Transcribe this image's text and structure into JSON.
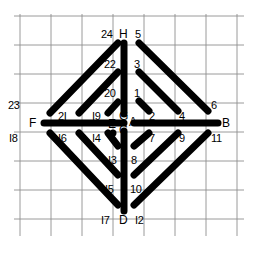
{
  "figure": {
    "type": "line-diagram",
    "canvas": {
      "width": 260,
      "height": 263
    },
    "colors": {
      "stroke": "#000000",
      "grid": "#8a8a8a",
      "background": "#ffffff"
    },
    "grid": {
      "visible": true,
      "x_lines": [
        20,
        51,
        82,
        113,
        144,
        175,
        206,
        237
      ],
      "y_lines": [
        16,
        45,
        74,
        103,
        132,
        161,
        190,
        219,
        234
      ]
    },
    "nodes": {
      "A": {
        "x": 133,
        "y": 124
      },
      "B": {
        "x": 219,
        "y": 124
      },
      "C": {
        "x": 124,
        "y": 131
      },
      "D": {
        "x": 124,
        "y": 211
      },
      "E": {
        "x": 126,
        "y": 124
      },
      "F": {
        "x": 43,
        "y": 124
      },
      "G": {
        "x": 124,
        "y": 116
      },
      "H": {
        "x": 124,
        "y": 43
      }
    },
    "segments": [
      {
        "id": "H-G",
        "from": "H",
        "to": "G",
        "ends": [
          "H",
          "G"
        ],
        "orientation": "vertical"
      },
      {
        "id": "C-D",
        "from": "C",
        "to": "D",
        "ends": [
          "C",
          "D"
        ],
        "orientation": "vertical"
      },
      {
        "id": "F-E",
        "from": "F",
        "to": "E",
        "ends": [
          "F",
          "E"
        ],
        "orientation": "horizontal"
      },
      {
        "id": "A-B",
        "from": "A",
        "to": "B",
        "ends": [
          "A",
          "B"
        ],
        "orientation": "horizontal"
      },
      {
        "id": "1-2",
        "ends": [
          "1",
          "2"
        ],
        "orientation": "diagonal-down-right"
      },
      {
        "id": "3-4",
        "ends": [
          "3",
          "4"
        ],
        "orientation": "diagonal-down-right"
      },
      {
        "id": "5-6",
        "ends": [
          "5",
          "6"
        ],
        "orientation": "diagonal-down-right"
      },
      {
        "id": "7-8",
        "ends": [
          "7",
          "8"
        ],
        "orientation": "diagonal-down-left"
      },
      {
        "id": "9-10",
        "ends": [
          "9",
          "10"
        ],
        "orientation": "diagonal-down-left"
      },
      {
        "id": "11-12",
        "ends": [
          "11",
          "12"
        ],
        "orientation": "diagonal-down-left"
      },
      {
        "id": "13-14",
        "ends": [
          "I3",
          "I4"
        ],
        "orientation": "diagonal-down-left"
      },
      {
        "id": "15-16",
        "ends": [
          "I5",
          "I6"
        ],
        "orientation": "diagonal-down-left"
      },
      {
        "id": "17-18",
        "ends": [
          "I7",
          "I8"
        ],
        "orientation": "diagonal-down-left"
      },
      {
        "id": "19-20",
        "ends": [
          "I9",
          "20"
        ],
        "orientation": "diagonal-up-right"
      },
      {
        "id": "21-22",
        "ends": [
          "2I",
          "22"
        ],
        "orientation": "diagonal-up-right"
      },
      {
        "id": "23-24",
        "ends": [
          "23",
          "24"
        ],
        "orientation": "diagonal-up-right"
      }
    ],
    "labels": [
      {
        "id": "lab-24",
        "text": "24",
        "x": 101,
        "y": 29,
        "kind": "number"
      },
      {
        "id": "lab-H",
        "text": "H",
        "x": 119,
        "y": 29,
        "kind": "letter"
      },
      {
        "id": "lab-5",
        "text": "5",
        "x": 135,
        "y": 29,
        "kind": "number"
      },
      {
        "id": "lab-22",
        "text": "22",
        "x": 104,
        "y": 59,
        "kind": "number"
      },
      {
        "id": "lab-3",
        "text": "3",
        "x": 134,
        "y": 59,
        "kind": "number"
      },
      {
        "id": "lab-20",
        "text": "20",
        "x": 104,
        "y": 88,
        "kind": "number"
      },
      {
        "id": "lab-1",
        "text": "1",
        "x": 134,
        "y": 88,
        "kind": "number"
      },
      {
        "id": "lab-23",
        "text": "23",
        "x": 8,
        "y": 100,
        "kind": "number"
      },
      {
        "id": "lab-21",
        "text": "2I",
        "x": 58,
        "y": 111,
        "kind": "number"
      },
      {
        "id": "lab-19",
        "text": "I9",
        "x": 92,
        "y": 111,
        "kind": "number"
      },
      {
        "id": "lab-2",
        "text": "2",
        "x": 149,
        "y": 111,
        "kind": "number"
      },
      {
        "id": "lab-4",
        "text": "4",
        "x": 179,
        "y": 111,
        "kind": "number"
      },
      {
        "id": "lab-6",
        "text": "6",
        "x": 211,
        "y": 100,
        "kind": "number"
      },
      {
        "id": "lab-G",
        "text": "G",
        "x": 119,
        "y": 111,
        "kind": "letter"
      },
      {
        "id": "lab-A",
        "text": "A",
        "x": 129,
        "y": 117,
        "kind": "letter"
      },
      {
        "id": "lab-E",
        "text": "E",
        "x": 108,
        "y": 119,
        "kind": "letter"
      },
      {
        "id": "lab-C",
        "text": "C",
        "x": 119,
        "y": 125,
        "kind": "letter"
      },
      {
        "id": "lab-F",
        "text": "F",
        "x": 29,
        "y": 118,
        "kind": "letter"
      },
      {
        "id": "lab-B",
        "text": "B",
        "x": 222,
        "y": 118,
        "kind": "letter"
      },
      {
        "id": "lab-18",
        "text": "I8",
        "x": 9,
        "y": 133,
        "kind": "number"
      },
      {
        "id": "lab-16",
        "text": "I6",
        "x": 58,
        "y": 133,
        "kind": "number"
      },
      {
        "id": "lab-14",
        "text": "I4",
        "x": 92,
        "y": 133,
        "kind": "number"
      },
      {
        "id": "lab-7",
        "text": "7",
        "x": 149,
        "y": 133,
        "kind": "number"
      },
      {
        "id": "lab-9",
        "text": "9",
        "x": 179,
        "y": 133,
        "kind": "number"
      },
      {
        "id": "lab-11",
        "text": "11",
        "x": 211,
        "y": 133,
        "kind": "number"
      },
      {
        "id": "lab-13",
        "text": "I3",
        "x": 108,
        "y": 155,
        "kind": "number"
      },
      {
        "id": "lab-8",
        "text": "8",
        "x": 131,
        "y": 155,
        "kind": "number"
      },
      {
        "id": "lab-15",
        "text": "I5",
        "x": 105,
        "y": 184,
        "kind": "number"
      },
      {
        "id": "lab-10",
        "text": "10",
        "x": 130,
        "y": 184,
        "kind": "number"
      },
      {
        "id": "lab-17",
        "text": "I7",
        "x": 101,
        "y": 215,
        "kind": "number"
      },
      {
        "id": "lab-D",
        "text": "D",
        "x": 119,
        "y": 215,
        "kind": "letter"
      },
      {
        "id": "lab-12",
        "text": "I2",
        "x": 135,
        "y": 215,
        "kind": "number"
      }
    ]
  }
}
